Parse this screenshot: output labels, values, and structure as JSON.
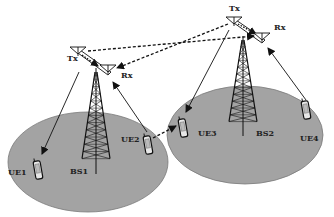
{
  "diagram": {
    "type": "network-topology",
    "colors": {
      "cell_fill": "#a3a3a3",
      "cell_stroke": "#7a7a7a",
      "line": "#111111",
      "background": "#ffffff"
    },
    "cells": [
      {
        "id": "cell1",
        "cx": 88,
        "cy": 162,
        "rx": 80,
        "ry": 50
      },
      {
        "id": "cell2",
        "cx": 245,
        "cy": 135,
        "rx": 78,
        "ry": 49
      }
    ],
    "base_stations": [
      {
        "id": "BS1",
        "label": "BS1",
        "tower_x": 96,
        "tower_top": 72,
        "tower_bottom": 174,
        "label_x": 70,
        "label_y": 174,
        "tx": {
          "label": "Tx",
          "x": 78,
          "y": 52,
          "label_x": 67,
          "label_y": 61
        },
        "rx": {
          "label": "Rx",
          "x": 108,
          "y": 70,
          "label_x": 121,
          "label_y": 78
        }
      },
      {
        "id": "BS2",
        "label": "BS2",
        "tower_x": 243,
        "tower_top": 40,
        "tower_bottom": 136,
        "label_x": 256,
        "label_y": 136,
        "tx": {
          "label": "Tx",
          "x": 234,
          "y": 22,
          "label_x": 229,
          "label_y": 11
        },
        "rx": {
          "label": "Rx",
          "x": 262,
          "y": 38,
          "label_x": 274,
          "label_y": 30
        }
      }
    ],
    "user_equipment": [
      {
        "id": "UE1",
        "label": "UE1",
        "x": 38,
        "y": 170,
        "label_x": 8,
        "label_y": 175
      },
      {
        "id": "UE2",
        "label": "UE2",
        "x": 148,
        "y": 145,
        "label_x": 121,
        "label_y": 142
      },
      {
        "id": "UE3",
        "label": "UE3",
        "x": 183,
        "y": 128,
        "label_x": 198,
        "label_y": 136
      },
      {
        "id": "UE4",
        "label": "UE4",
        "x": 306,
        "y": 110,
        "label_x": 300,
        "label_y": 141
      }
    ],
    "links": [
      {
        "from": "BS1.Tx",
        "to": "UE1",
        "style": "solid",
        "arrow": "end",
        "x1": 79,
        "y1": 72,
        "x2": 42,
        "y2": 154
      },
      {
        "from": "UE2",
        "to": "BS1.Rx",
        "style": "solid",
        "arrow": "end",
        "x1": 147,
        "y1": 132,
        "x2": 113,
        "y2": 82
      },
      {
        "from": "BS2.Tx",
        "to": "UE3",
        "style": "solid",
        "arrow": "end",
        "x1": 229,
        "y1": 30,
        "x2": 186,
        "y2": 112
      },
      {
        "from": "UE4",
        "to": "BS2.Rx",
        "style": "solid",
        "arrow": "end",
        "x1": 306,
        "y1": 100,
        "x2": 268,
        "y2": 48
      },
      {
        "from": "BS1.Tx",
        "to": "BS2.Rx",
        "style": "dashed",
        "arrow": "end",
        "x1": 88,
        "y1": 51,
        "x2": 254,
        "y2": 36
      },
      {
        "from": "BS2.Tx",
        "to": "BS1.Rx",
        "style": "dashed",
        "arrow": "end",
        "x1": 228,
        "y1": 24,
        "x2": 117,
        "y2": 68
      },
      {
        "from": "BS1.Tx",
        "to": "BS1.Rx",
        "style": "dotted",
        "arrow": "end",
        "x1": 82,
        "y1": 55,
        "x2": 98,
        "y2": 66
      },
      {
        "from": "BS2.Tx",
        "to": "BS2.Rx",
        "style": "dotted",
        "arrow": "end",
        "x1": 238,
        "y1": 24,
        "x2": 256,
        "y2": 34
      },
      {
        "from": "UE2",
        "to": "UE3",
        "style": "dashed",
        "arrow": "end",
        "x1": 153,
        "y1": 138,
        "x2": 176,
        "y2": 126
      }
    ]
  }
}
